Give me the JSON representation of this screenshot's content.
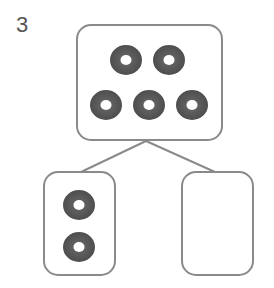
{
  "problem": {
    "number": "3",
    "type": "number-bond",
    "whole": {
      "count": 5,
      "label": "whole"
    },
    "parts": [
      {
        "count": 2,
        "label": "known-part"
      },
      {
        "count": null,
        "label": "missing-part"
      }
    ]
  },
  "colors": {
    "box_stroke": "#8a8a8a",
    "connector": "#8a8a8a",
    "donut_fill": "#5a5a5a",
    "donut_hole": "#ffffff",
    "text": "#555555"
  },
  "icons": {
    "item": "donut-icon"
  }
}
